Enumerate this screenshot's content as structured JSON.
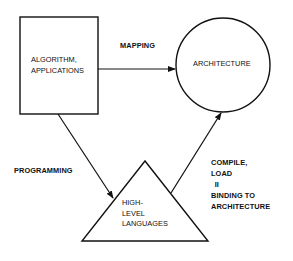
{
  "diagram": {
    "nodes": {
      "algorithm": {
        "shape": "rectangle",
        "lines": [
          "ALGORITHM,",
          "APPLICATIONS"
        ]
      },
      "architecture": {
        "shape": "circle",
        "lines": [
          "ARCHITECTURE"
        ]
      },
      "languages": {
        "shape": "triangle",
        "lines": [
          "HIGH-",
          "LEVEL",
          "LANGUAGES"
        ]
      }
    },
    "edges": {
      "mapping": {
        "from": "algorithm",
        "to": "architecture",
        "label": "MAPPING"
      },
      "programming": {
        "from": "algorithm",
        "to": "languages",
        "label": "PROGRAMMING"
      },
      "compile": {
        "from": "languages",
        "to": "architecture",
        "lines": [
          "COMPILE,",
          "LOAD",
          "II",
          "BINDING TO",
          "ARCHITECTURE"
        ]
      }
    },
    "colors": {
      "stroke": "#111111",
      "background": "#ffffff"
    }
  }
}
